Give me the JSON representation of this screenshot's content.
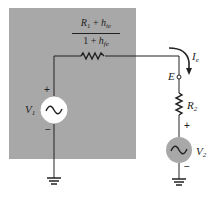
{
  "diagram": {
    "type": "equivalent-circuit",
    "background_color": "#a8a8a8",
    "equivalent_resistor": {
      "numerator": {
        "R": "R",
        "R_sub": "1",
        "plus": " + ",
        "h": "h",
        "h_sub": "ie"
      },
      "denominator": {
        "one": "1",
        "plus": " + ",
        "h": "h",
        "h_sub": "fe"
      }
    },
    "source_left": {
      "name": "V",
      "sub": "1",
      "plus": "+",
      "minus": "−",
      "fill": "#ffffff"
    },
    "source_right": {
      "name": "V",
      "sub": "2",
      "plus": "+",
      "minus": "−",
      "fill": "#a8a8a8"
    },
    "resistor_right": {
      "name": "R",
      "sub": "2"
    },
    "terminal": {
      "name": "E"
    },
    "current": {
      "name": "I",
      "sub": "e"
    }
  }
}
